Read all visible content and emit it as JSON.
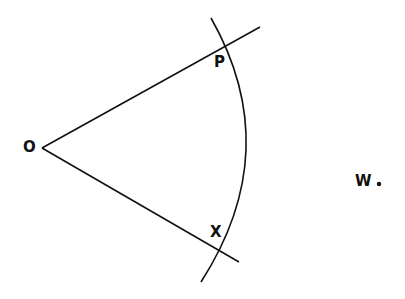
{
  "diagram": {
    "type": "geometric-construction",
    "labels": {
      "vertex": "O",
      "upper_intersection": "P",
      "lower_intersection": "X",
      "external_point": "W"
    },
    "points": {
      "O": [
        42,
        148
      ],
      "upper_ray_end": [
        260,
        27
      ],
      "lower_ray_end": [
        239,
        262
      ],
      "arc_start": [
        211,
        18
      ],
      "arc_end": [
        201,
        282
      ],
      "W_dot": [
        379,
        183
      ]
    },
    "colors": {
      "stroke": "#111111",
      "background": "#ffffff"
    }
  }
}
